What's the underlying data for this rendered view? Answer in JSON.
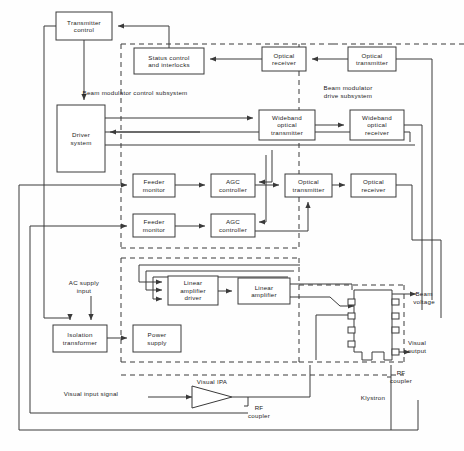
{
  "diagram": {
    "type": "block-diagram",
    "blocks": [
      {
        "id": "transmitter-control",
        "label_lines": [
          "Transmitter",
          "control"
        ],
        "x": 56,
        "y": 12,
        "w": 56,
        "h": 28
      },
      {
        "id": "status-control",
        "label_lines": [
          "Status control",
          "and interlocks"
        ],
        "x": 134,
        "y": 48,
        "w": 70,
        "h": 26
      },
      {
        "id": "optical-receiver-top",
        "label_lines": [
          "Optical",
          "receiver"
        ],
        "x": 262,
        "y": 47,
        "w": 44,
        "h": 24
      },
      {
        "id": "optical-transmitter-top",
        "label_lines": [
          "Optical",
          "transmitter"
        ],
        "x": 348,
        "y": 47,
        "w": 48,
        "h": 24
      },
      {
        "id": "driver-system",
        "label_lines": [
          "Driver",
          "system"
        ],
        "x": 57,
        "y": 105,
        "w": 48,
        "h": 67
      },
      {
        "id": "wideband-optical-transmitter",
        "label_lines": [
          "Wideband",
          "optical",
          "transmitter"
        ],
        "x": 259,
        "y": 110,
        "w": 56,
        "h": 30
      },
      {
        "id": "wideband-optical-receiver",
        "label_lines": [
          "Wideband",
          "optical",
          "receiver"
        ],
        "x": 350,
        "y": 110,
        "w": 54,
        "h": 30
      },
      {
        "id": "feeder-monitor-1",
        "label_lines": [
          "Feeder",
          "monitor"
        ],
        "x": 133,
        "y": 174,
        "w": 42,
        "h": 23
      },
      {
        "id": "agc-controller-1",
        "label_lines": [
          "AGC",
          "controller"
        ],
        "x": 211,
        "y": 174,
        "w": 44,
        "h": 23
      },
      {
        "id": "optical-transmitter-mid",
        "label_lines": [
          "Optical",
          "transmitter"
        ],
        "x": 285,
        "y": 174,
        "w": 47,
        "h": 23
      },
      {
        "id": "optical-receiver-mid",
        "label_lines": [
          "Optical",
          "receiver"
        ],
        "x": 351,
        "y": 174,
        "w": 45,
        "h": 23
      },
      {
        "id": "feeder-monitor-2",
        "label_lines": [
          "Feeder",
          "monitor"
        ],
        "x": 133,
        "y": 214,
        "w": 42,
        "h": 23
      },
      {
        "id": "agc-controller-2",
        "label_lines": [
          "AGC",
          "controller"
        ],
        "x": 211,
        "y": 214,
        "w": 44,
        "h": 23
      },
      {
        "id": "linear-amplifier-driver",
        "label_lines": [
          "Linear",
          "amplifier",
          "driver"
        ],
        "x": 168,
        "y": 276,
        "w": 50,
        "h": 29
      },
      {
        "id": "linear-amplifier",
        "label_lines": [
          "Linear",
          "amplifier"
        ],
        "x": 238,
        "y": 278,
        "w": 52,
        "h": 26
      },
      {
        "id": "isolation-transformer",
        "label_lines": [
          "Isolation",
          "transformer"
        ],
        "x": 53,
        "y": 325,
        "w": 54,
        "h": 27
      },
      {
        "id": "power-supply",
        "label_lines": [
          "Power",
          "supply"
        ],
        "x": 133,
        "y": 325,
        "w": 48,
        "h": 27
      }
    ],
    "subsystem_labels": [
      {
        "id": "beam-modulator-control-subsystem",
        "text_lines": [
          "Beam modulator control subsystem"
        ],
        "x": 135,
        "y": 95
      },
      {
        "id": "beam-modulator-drive-subsystem",
        "text_lines": [
          "Beam modulator",
          "drive subsystem"
        ],
        "x": 348,
        "y": 90
      }
    ],
    "annotations": [
      {
        "id": "ac-supply-input",
        "text_lines": [
          "AC supply",
          "input"
        ],
        "x": 84,
        "y": 285
      },
      {
        "id": "beam-voltage",
        "text_lines": [
          "Beam",
          "voltage"
        ],
        "x": 424,
        "y": 296
      },
      {
        "id": "visual-output",
        "text_lines": [
          "Visual",
          "output"
        ],
        "x": 417,
        "y": 345
      },
      {
        "id": "rf-coupler-klystron",
        "text_lines": [
          "RF",
          "coupler"
        ],
        "x": 401,
        "y": 375
      },
      {
        "id": "rf-coupler-ipa",
        "text_lines": [
          "RF",
          "coupler"
        ],
        "x": 259,
        "y": 410
      },
      {
        "id": "visual-input-signal",
        "text_lines": [
          "Visual input signal"
        ],
        "x": 91,
        "y": 396
      },
      {
        "id": "visual-ipa",
        "text_lines": [
          "Visual IPA"
        ],
        "x": 212,
        "y": 384
      },
      {
        "id": "klystron",
        "text_lines": [
          "Klystron"
        ],
        "x": 373,
        "y": 400
      }
    ],
    "colors": {
      "line": "#3a3a3a",
      "box_fill": "#ffffff",
      "background": "#fefefe",
      "text": "#1c1c1c"
    }
  }
}
